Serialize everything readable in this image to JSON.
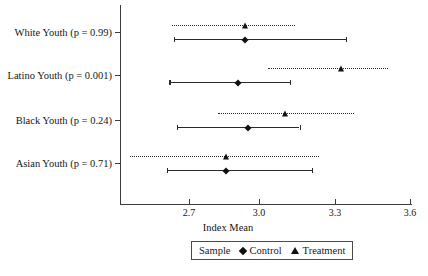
{
  "chart_data": {
    "type": "scatter",
    "title": "",
    "xlabel": "Index Mean",
    "ylabel": "",
    "xlim": [
      2.55,
      3.72
    ],
    "xticks": [
      2.7,
      3.0,
      3.3,
      3.6
    ],
    "xtick_labels": [
      "2.7",
      "3.0",
      "3.3",
      "3.6"
    ],
    "grid": false,
    "legend_position": "bottom",
    "categories": [
      "White Youth (p = 0.99)",
      "Latino Youth (p = 0.001)",
      "Black Youth (p = 0.24)",
      "Asian Youth (p = 0.71)"
    ],
    "series": [
      {
        "name": "Control",
        "marker": "diamond",
        "line_style": "solid",
        "points": [
          {
            "category": "White Youth (p = 0.99)",
            "value": 2.93,
            "ci_low": 2.64,
            "ci_high": 3.34
          },
          {
            "category": "Latino Youth (p = 0.001)",
            "value": 2.9,
            "ci_low": 2.62,
            "ci_high": 3.11
          },
          {
            "category": "Black Youth (p = 0.24)",
            "value": 2.94,
            "ci_low": 2.65,
            "ci_high": 3.15
          },
          {
            "category": "Asian Youth (p = 0.71)",
            "value": 2.85,
            "ci_low": 2.61,
            "ci_high": 3.2
          }
        ]
      },
      {
        "name": "Treatment",
        "marker": "triangle",
        "line_style": "dotted",
        "points": [
          {
            "category": "White Youth (p = 0.99)",
            "value": 2.93,
            "ci_low": 2.63,
            "ci_high": 3.13
          },
          {
            "category": "Latino Youth (p = 0.001)",
            "value": 3.32,
            "ci_low": 3.02,
            "ci_high": 3.51
          },
          {
            "category": "Black Youth (p = 0.24)",
            "value": 3.09,
            "ci_low": 2.82,
            "ci_high": 3.37
          },
          {
            "category": "Asian Youth (p = 0.71)",
            "value": 2.85,
            "ci_low": 2.46,
            "ci_high": 3.23
          }
        ]
      }
    ]
  },
  "legend": {
    "title": "Sample",
    "entries": [
      {
        "label": "Control",
        "glyph": "diamond-marker-icon"
      },
      {
        "label": "Treatment",
        "glyph": "triangle-marker-icon"
      }
    ]
  }
}
